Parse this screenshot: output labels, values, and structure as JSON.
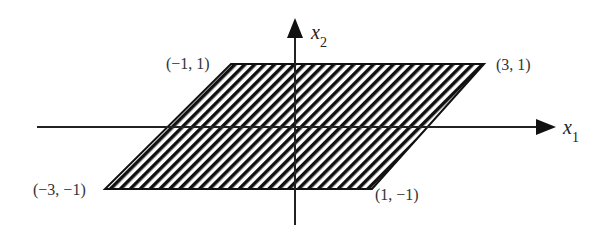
{
  "diagram": {
    "region": {
      "description": "hatched parallelogram",
      "vertices": [
        {
          "label": "(−3, −1)",
          "x": -3,
          "y": -1
        },
        {
          "label": "(1, −1)",
          "x": 1,
          "y": -1
        },
        {
          "label": "(3, 1)",
          "x": 3,
          "y": 1
        },
        {
          "label": "(−1, 1)",
          "x": -1,
          "y": 1
        }
      ],
      "fill_pattern": "diagonal-hatch",
      "stroke_color": "#111111"
    },
    "axes": {
      "x": {
        "symbol": "x",
        "subscript": "1"
      },
      "y": {
        "symbol": "x",
        "subscript": "2"
      }
    }
  }
}
